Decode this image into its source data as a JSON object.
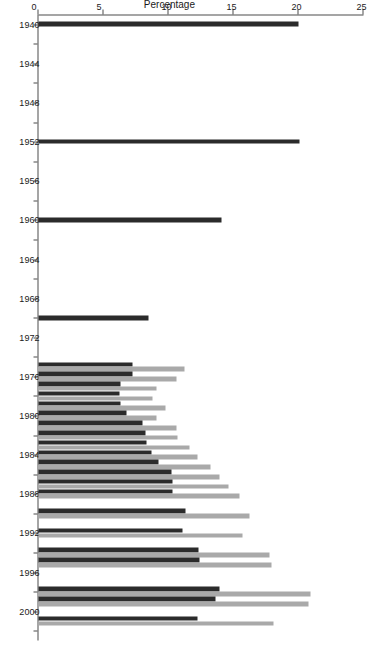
{
  "chart_data": {
    "type": "bar",
    "title": "",
    "subtitle": "",
    "orientation": "horizontal",
    "xlabel": "",
    "ylabel": "Percentage",
    "ylim": [
      0,
      25
    ],
    "yticks": [
      25,
      20,
      15,
      10,
      5,
      0
    ],
    "ytick_labels": [
      "25",
      "20",
      "15",
      "10",
      "5",
      "0"
    ],
    "grid": false,
    "legend": "none",
    "xtick_labels": [
      "1940",
      "1944",
      "1948",
      "1952",
      "1956",
      "1960",
      "1964",
      "1968",
      "1972",
      "1976",
      "1980",
      "1984",
      "1988",
      "1992",
      "1996",
      "2000"
    ],
    "xtick_years": [
      1940,
      1944,
      1948,
      1952,
      1956,
      1960,
      1964,
      1968,
      1972,
      1976,
      1980,
      1984,
      1988,
      1992,
      1996,
      2000
    ],
    "xlim_years": [
      1939,
      2003
    ],
    "categories": [
      1940,
      1952,
      1960,
      1970,
      1975,
      1976,
      1977,
      1978,
      1979,
      1980,
      1981,
      1982,
      1983,
      1984,
      1985,
      1986,
      1987,
      1988,
      1990,
      1992,
      1994,
      1995,
      1998,
      1999,
      2001
    ],
    "series": [
      {
        "name": "series-dark",
        "color": "#2b2b2b",
        "values": [
          20.0,
          20.1,
          14.1,
          8.5,
          7.2,
          7.2,
          6.3,
          6.2,
          6.3,
          6.8,
          8.0,
          8.2,
          8.3,
          8.7,
          9.2,
          10.2,
          10.3,
          10.3,
          11.3,
          11.1,
          12.3,
          12.4,
          13.9,
          13.6,
          12.2
        ]
      },
      {
        "name": "series-light",
        "color": "#a9a9a9",
        "values": [
          null,
          null,
          null,
          null,
          11.2,
          10.6,
          9.1,
          8.8,
          9.8,
          9.1,
          10.6,
          10.7,
          11.6,
          12.2,
          13.2,
          13.9,
          14.6,
          15.5,
          16.2,
          15.7,
          17.8,
          17.9,
          20.9,
          20.8,
          18.1
        ]
      }
    ]
  },
  "axis": {
    "value_axis_label": "Percentage"
  }
}
